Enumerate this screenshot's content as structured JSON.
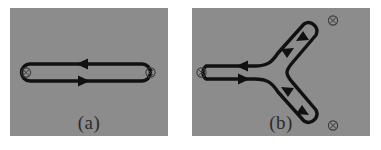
{
  "figure": {
    "background_color": "#ffffff",
    "panel_background_color": "#8c8c8c",
    "wire_color": "#111111",
    "marker_color": "#3a3a3a",
    "width": 381,
    "height": 150
  },
  "panels": [
    {
      "id": "a",
      "label": "(a)",
      "description": "two-legged oriented loop with crossed-circle endpoints",
      "leg_count": 2,
      "marker_count": 2,
      "arrow_count": 2,
      "arrow_directions": [
        "left",
        "right"
      ],
      "orientation": "counterclockwise"
    },
    {
      "id": "b",
      "label": "(b)",
      "description": "three-legged Y-shaped oriented loop with crossed-circle endpoints",
      "leg_count": 3,
      "marker_count": 3,
      "arrow_count": 6,
      "arrow_directions": [
        "left",
        "right",
        "up-left",
        "up-right",
        "down-right",
        "down-left"
      ],
      "orientation": "counterclockwise"
    }
  ],
  "markers": {
    "glyph": "circle-with-cross",
    "panel_a": [
      {
        "name": "endpoint-left",
        "x": 16,
        "y": 64
      },
      {
        "name": "endpoint-right",
        "x": 140,
        "y": 64
      }
    ],
    "panel_b": [
      {
        "name": "endpoint-left",
        "x": 9,
        "y": 65
      },
      {
        "name": "endpoint-top-right",
        "x": 141,
        "y": 12
      },
      {
        "name": "endpoint-bottom-right",
        "x": 141,
        "y": 119
      }
    ]
  }
}
